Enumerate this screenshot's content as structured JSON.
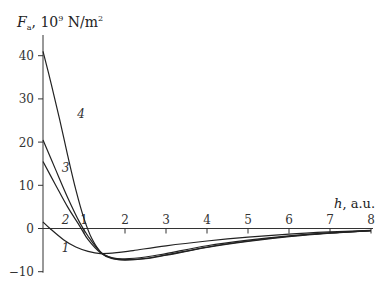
{
  "chart_data": {
    "type": "line",
    "title": "",
    "ylabel": {
      "symbol": "F",
      "subscript": "a",
      "unit_prefix": "10",
      "unit_exp": "9",
      "unit": "N/m",
      "unit_unit_exp": "2"
    },
    "ylabel_text": "F_a, 10^9 N/m^2",
    "xlabel": {
      "symbol": "h",
      "unit": "a.u."
    },
    "xlabel_text": "h, a.u.",
    "xlim": [
      0,
      8
    ],
    "ylim": [
      -10,
      45
    ],
    "xticks": [
      1,
      2,
      3,
      4,
      5,
      6,
      7,
      8
    ],
    "yticks": [
      -10,
      0,
      10,
      20,
      30,
      40
    ],
    "grid": false,
    "legend": "inline curve labels",
    "series": [
      {
        "name": "1",
        "label_pos": [
          0.55,
          -4.5
        ],
        "x": [
          0,
          0.17,
          0.5,
          0.8,
          1.1,
          1.4,
          1.8,
          2.2,
          3,
          4,
          5,
          6,
          7,
          8
        ],
        "values": [
          1.5,
          0,
          -2.6,
          -4.3,
          -5.3,
          -5.8,
          -5.6,
          -5.1,
          -4.0,
          -2.9,
          -2.0,
          -1.3,
          -0.8,
          -0.4
        ]
      },
      {
        "name": "2",
        "label_pos": [
          0.55,
          2.0
        ],
        "x": [
          0,
          0.3,
          0.6,
          0.9,
          1.1,
          1.4,
          1.7,
          2.0,
          2.5,
          3,
          4,
          5,
          6,
          7,
          8
        ],
        "values": [
          15.5,
          10.2,
          5.0,
          0.5,
          -2.6,
          -5.6,
          -6.8,
          -7.0,
          -6.6,
          -5.8,
          -4.0,
          -2.7,
          -1.7,
          -1.0,
          -0.5
        ]
      },
      {
        "name": "3",
        "label_pos": [
          0.55,
          14.0
        ],
        "x": [
          0,
          0.3,
          0.6,
          0.9,
          1.1,
          1.4,
          1.7,
          2.0,
          2.5,
          3,
          4,
          5,
          6,
          7,
          8
        ],
        "values": [
          20.5,
          13.8,
          7.2,
          1.3,
          -1.8,
          -5.4,
          -6.9,
          -7.2,
          -6.9,
          -6.1,
          -4.3,
          -2.9,
          -1.8,
          -1.0,
          -0.5
        ]
      },
      {
        "name": "4",
        "label_pos": [
          0.93,
          26.5
        ],
        "x": [
          0,
          0.2,
          0.4,
          0.6,
          0.8,
          1.0,
          1.2,
          1.45,
          1.7,
          2.0,
          2.5,
          3,
          4,
          5,
          6,
          7,
          8
        ],
        "values": [
          41,
          33.5,
          25.5,
          17,
          9,
          2.3,
          -2.5,
          -5.9,
          -7.0,
          -7.3,
          -7.0,
          -6.2,
          -4.4,
          -3.0,
          -1.9,
          -1.1,
          -0.5
        ]
      }
    ]
  }
}
